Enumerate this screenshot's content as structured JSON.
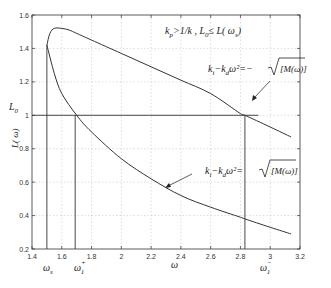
{
  "chart_data": {
    "type": "line",
    "title": "",
    "annotation_top": "k_p>1/k , L_0≤ L(ω_s)",
    "xlabel": "ω",
    "ylabel": "L(ω)",
    "ylabel_extra": "L_0",
    "xlim": [
      1.4,
      3.2
    ],
    "ylim": [
      0.2,
      1.6
    ],
    "grid": true,
    "x_ticks": [
      "1.4",
      "1.6",
      "1.8",
      "2",
      "2.2",
      "2.4",
      "2.6",
      "2.8",
      "3",
      "3.2"
    ],
    "y_ticks": [
      "0.2",
      "0.4",
      "0.6",
      "0.8",
      "1",
      "1.2",
      "1.4",
      "1.6"
    ],
    "series": [
      {
        "name": "k_i−k_d ω² = −√[M(ω)]",
        "x": [
          1.5,
          1.52,
          1.55,
          1.6,
          1.65,
          1.7,
          1.8,
          2.0,
          2.2,
          2.4,
          2.6,
          2.8,
          2.83,
          3.0,
          3.14
        ],
        "y": [
          1.42,
          1.49,
          1.52,
          1.52,
          1.51,
          1.49,
          1.45,
          1.37,
          1.29,
          1.21,
          1.13,
          1.01,
          1.0,
          0.93,
          0.87
        ]
      },
      {
        "name": "k_i−k_d ω² = √[M(ω)]",
        "x": [
          1.5,
          1.55,
          1.6,
          1.7,
          1.8,
          2.0,
          2.2,
          2.4,
          2.6,
          2.8,
          2.83,
          3.0,
          3.14
        ],
        "y": [
          1.42,
          1.25,
          1.13,
          1.0,
          0.9,
          0.74,
          0.62,
          0.52,
          0.45,
          0.39,
          0.38,
          0.33,
          0.29
        ]
      }
    ],
    "reference_lines": {
      "horizontal": {
        "y": 1.0,
        "label": "L_0"
      },
      "vertical": [
        {
          "x": 1.5,
          "label": "ω_s"
        },
        {
          "x": 1.69,
          "label": "ω_1^+"
        },
        {
          "x": 2.83,
          "label": "ω_1^-"
        }
      ]
    },
    "annotations": [
      {
        "text": "k_i−k_d ω²=− √[M(ω)]",
        "arrow_to": [
          2.65,
          1.1
        ]
      },
      {
        "text": "k_i−k_d ω²= √[M(ω)]",
        "arrow_to": [
          2.15,
          0.64
        ]
      }
    ]
  },
  "labels": {
    "top_annotation_k": "k",
    "top_annotation_p": "p",
    "top_annotation_rest": ">1/k , L",
    "top_annotation_0": "0",
    "top_annotation_le": "≤ L( ω",
    "top_annotation_s": "s",
    "top_annotation_close": ")",
    "upper_eq": "k",
    "upper_eq_i": "i",
    "upper_eq_mid": "−k",
    "upper_eq_d": "d",
    "upper_eq_tail": "ω²=− ",
    "upper_eq_sqrt": "[M(ω)]",
    "lower_eq": "k",
    "lower_eq_i": "i",
    "lower_eq_mid": "−k",
    "lower_eq_d": "d",
    "lower_eq_tail": "ω²= ",
    "lower_eq_sqrt": "[M(ω)]",
    "y_L0": "L",
    "y_L0_sub": "0",
    "y_axis_label": "L( ω)",
    "x_axis_label": "ω",
    "ws": "ω",
    "ws_sub": "s",
    "w1p": "ω",
    "w1p_sup": "+",
    "w1p_sub": "1",
    "w1m": "ω",
    "w1m_sup": "−",
    "w1m_sub": "1"
  }
}
